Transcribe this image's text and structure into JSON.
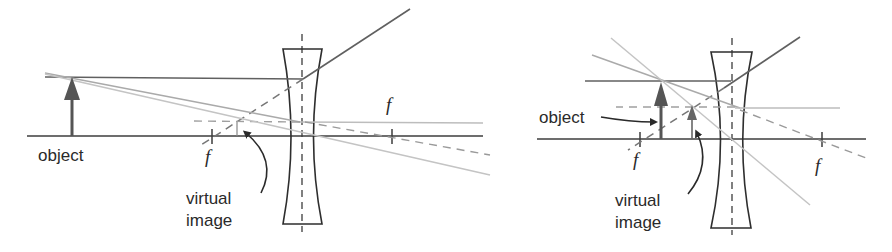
{
  "colors": {
    "background": "#ffffff",
    "axis": "#3c3c3c",
    "lens_outline": "#2e2e2e",
    "object_arrow": "#555555",
    "image_arrow": "#666666",
    "dark_ray": "#606060",
    "light_ray": "#bdbdbd",
    "dashed_ray": "#8a8a8a",
    "text": "#2a2a2a"
  },
  "diagrams": [
    {
      "id": "left",
      "description": "Diverging lens, object outside focal length",
      "labels": {
        "object": "object",
        "virtual_line1": "virtual",
        "virtual_line2": "image",
        "focal_left": "f",
        "focal_right": "f"
      }
    },
    {
      "id": "right",
      "description": "Diverging lens, object inside focal length",
      "labels": {
        "object": "object",
        "virtual_line1": "virtual",
        "virtual_line2": "image",
        "focal_left": "f",
        "focal_right": "f"
      }
    }
  ]
}
